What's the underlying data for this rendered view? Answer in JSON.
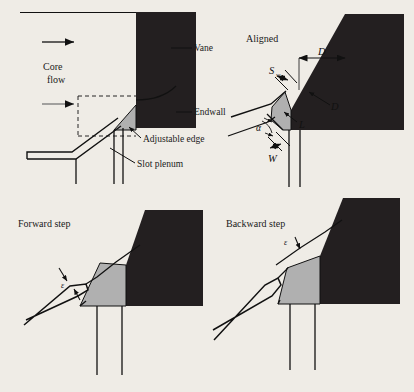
{
  "figure": {
    "background_color": "#efece6",
    "vane_color": "#231f20",
    "edge_color": "#b0b0b0",
    "line_color": "#111111"
  },
  "panels": {
    "top_left": {
      "labels": {
        "core_flow_line1": "Core",
        "core_flow_line2": "flow",
        "vane": "Vane",
        "endwall": "Endwall",
        "adjustable_edge": "Adjustable edge",
        "slot_plenum": "Slot plenum"
      }
    },
    "top_right": {
      "title": "Aligned",
      "symbols": {
        "slot_width": "S",
        "slot_width_sub": "w",
        "depth": "D",
        "diameter": "D",
        "length": "L",
        "angle": "α",
        "width": "W"
      }
    },
    "bottom_left": {
      "title": "Forward step",
      "symbols": {
        "step": "ε"
      }
    },
    "bottom_right": {
      "title": "Backward step",
      "symbols": {
        "step": "ε"
      }
    }
  }
}
